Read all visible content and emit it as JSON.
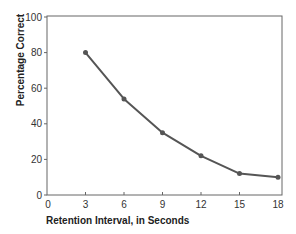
{
  "chart_data": {
    "type": "line",
    "title": "",
    "xlabel": "Retention Interval,  in Seconds",
    "ylabel": "Percentage Correct",
    "x": [
      3,
      6,
      9,
      12,
      15,
      18
    ],
    "values": [
      80,
      54,
      35,
      22,
      12,
      10
    ],
    "series": [
      {
        "name": "Percentage Correct",
        "x": [
          3,
          6,
          9,
          12,
          15,
          18
        ],
        "values": [
          80,
          54,
          35,
          22,
          12,
          10
        ]
      }
    ],
    "xticks": [
      0,
      3,
      6,
      9,
      12,
      15,
      18
    ],
    "yticks": [
      0,
      20,
      40,
      60,
      80,
      100
    ],
    "xlim": [
      0,
      18
    ],
    "ylim": [
      0,
      100
    ],
    "grid": false,
    "legend": null,
    "line_color": "#555555",
    "marker": "circle"
  },
  "labels": {
    "xlabel": "Retention Interval,  in Seconds",
    "ylabel": "Percentage Correct",
    "xticks": [
      "0",
      "3",
      "6",
      "9",
      "12",
      "15",
      "18"
    ],
    "yticks": [
      "0",
      "20",
      "40",
      "60",
      "80",
      "100"
    ]
  }
}
